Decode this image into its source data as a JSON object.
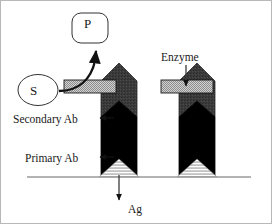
{
  "figure": {
    "background_color": "#ffffff",
    "border_color": "#b8b8b8",
    "width": 272,
    "height": 224
  },
  "labels": {
    "substrate": "S",
    "product": "P",
    "enzyme": "Enzyme",
    "secondary_antibody": "Secondary Ab",
    "primary_antibody": "Primary Ab",
    "antigen": "Ag"
  },
  "colors": {
    "secondary_ab_fill": "#3a3a3a",
    "primary_ab_fill": "#000000",
    "enzyme_fill": "#a8a8a8",
    "antigen_fill": "#bdbdbd",
    "baseline": "#9a9a9a",
    "outline": "#111111",
    "text": "#1a1a1a"
  },
  "elements": {
    "baseline_label": "solid support surface",
    "complex_count": 2,
    "arrows": [
      {
        "name": "substrate-to-product",
        "from": "S",
        "to": "P",
        "style": "curved"
      },
      {
        "name": "enzyme-pointer",
        "from": "Enzyme",
        "to": "enzyme-bar",
        "style": "straight-down"
      },
      {
        "name": "secondary-ab-pointer",
        "from": "Secondary Ab",
        "to": "secondary-ab-region",
        "style": "straight-right"
      },
      {
        "name": "primary-ab-pointer",
        "from": "Primary Ab",
        "to": "primary-ab-region",
        "style": "straight-right"
      },
      {
        "name": "antigen-pointer",
        "from": "antigen-triangle",
        "to": "Ag",
        "style": "straight-down"
      }
    ]
  }
}
